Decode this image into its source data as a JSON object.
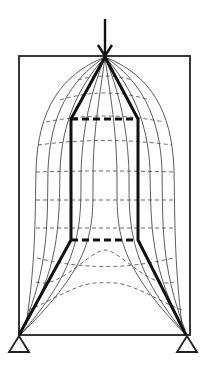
{
  "diagram": {
    "type": "strut-and-tie model with stress trajectories",
    "colors": {
      "line": "#111111",
      "background": "#ffffff"
    },
    "frame": {
      "x1": 19,
      "y1": 56,
      "x2": 190,
      "y2": 335
    },
    "load": {
      "label": "",
      "x": 105,
      "y_start": 19,
      "y_end": 57,
      "icon": "arrow-down-icon"
    },
    "supports": [
      {
        "name": "left-support",
        "x": 19,
        "y": 335,
        "icon": "triangle-support-icon"
      },
      {
        "name": "right-support",
        "x": 186,
        "y": 335,
        "icon": "triangle-support-icon"
      }
    ],
    "struts": [
      {
        "name": "left-strut",
        "points": [
          [
            105,
            57
          ],
          [
            71,
            119
          ],
          [
            71,
            240
          ],
          [
            19,
            335
          ]
        ]
      },
      {
        "name": "right-strut",
        "points": [
          [
            105,
            57
          ],
          [
            138,
            119
          ],
          [
            138,
            240
          ],
          [
            186,
            335
          ]
        ]
      }
    ],
    "ties": [
      {
        "name": "upper-tie",
        "y": 119,
        "x1": 71,
        "x2": 138
      },
      {
        "name": "lower-tie",
        "y": 240,
        "x1": 71,
        "x2": 138
      }
    ]
  }
}
